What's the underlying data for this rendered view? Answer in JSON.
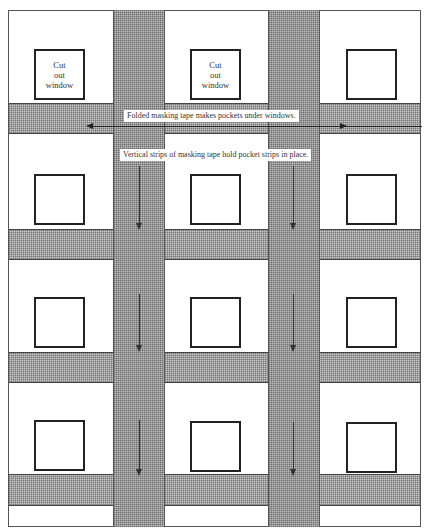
{
  "diagram": {
    "windows": [
      {
        "row": 0,
        "col": 0,
        "label": "Cut out window"
      },
      {
        "row": 0,
        "col": 1,
        "label": "Cut out window"
      },
      {
        "row": 0,
        "col": 2,
        "label": ""
      },
      {
        "row": 1,
        "col": 0,
        "label": ""
      },
      {
        "row": 1,
        "col": 1,
        "label": ""
      },
      {
        "row": 1,
        "col": 2,
        "label": ""
      },
      {
        "row": 2,
        "col": 0,
        "label": ""
      },
      {
        "row": 2,
        "col": 1,
        "label": ""
      },
      {
        "row": 2,
        "col": 2,
        "label": ""
      },
      {
        "row": 3,
        "col": 0,
        "label": ""
      },
      {
        "row": 3,
        "col": 1,
        "label": ""
      },
      {
        "row": 3,
        "col": 2,
        "label": ""
      }
    ],
    "window_label_lines": [
      "Cut",
      "out",
      "window"
    ],
    "annotations": {
      "folded_tape": "Folded masking tape makes pockets under windows.",
      "vertical_strips": "Vertical strips of masking tape hold pocket strips in place."
    },
    "colors": {
      "tape": "#c9c9c9",
      "window_border": "#222222",
      "background": "#ffffff"
    }
  }
}
